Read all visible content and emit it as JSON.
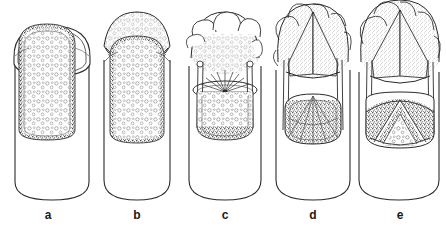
{
  "figure": {
    "style": "pen-and-ink line drawing, stippled shading, grayscale on white",
    "background_color": "#ffffff",
    "ink_color": "#1c1c1c",
    "stipple_color": "#555555",
    "fill_color": "#fdfdfd",
    "panel_count": 5
  },
  "panels": [
    {
      "label": "a",
      "label_x": 48,
      "label_y": 210,
      "cylinder": {
        "x": 14,
        "width": 76,
        "top": 40,
        "bottom": 200
      },
      "crown": {
        "type": "closed-dome",
        "description": "rounded cap enclosed by double outline, no external lobes",
        "top": 22,
        "bulge": 0
      },
      "interior": {
        "type": "cellular",
        "description": "scattered open cell circles inside a stippled border layer",
        "cell_count": 34,
        "has_granular_ring": true,
        "has_starburst": false,
        "arch_layers": 0
      },
      "struts": 0
    },
    {
      "label": "b",
      "label_x": 137,
      "label_y": 210,
      "cylinder": {
        "x": 103,
        "width": 69,
        "top": 46,
        "bottom": 200
      },
      "crown": {
        "type": "granular-cap",
        "description": "bumpy granular cap of small circles spilling over the rim",
        "top": 16,
        "bulge": 8
      },
      "interior": {
        "type": "cellular",
        "description": "open cell circles inside a stippled border layer",
        "cell_count": 30,
        "has_granular_ring": true,
        "has_starburst": false,
        "arch_layers": 0
      },
      "struts": 0
    },
    {
      "label": "c",
      "label_x": 225,
      "label_y": 210,
      "cylinder": {
        "x": 188,
        "width": 74,
        "top": 52,
        "bottom": 200
      },
      "crown": {
        "type": "lobed-foam",
        "description": "large lobed cloud-like crown of rounded bumps above a stippled mass",
        "top": 12,
        "bulge": 14
      },
      "interior": {
        "type": "cellular-with-burst",
        "description": "radiating starburst at centre above a cellular chamber with granular base",
        "cell_count": 22,
        "has_granular_ring": true,
        "has_starburst": true,
        "starburst_rays": 26,
        "arch_layers": 0
      },
      "struts": 4
    },
    {
      "label": "d",
      "label_x": 313,
      "label_y": 210,
      "cylinder": {
        "x": 275,
        "width": 75,
        "top": 56,
        "bottom": 200
      },
      "crown": {
        "type": "lobed-foam-split",
        "description": "broad lobed crown split by a dark central seam forming two inclined flanks",
        "top": 2,
        "bulge": 20
      },
      "interior": {
        "type": "domed-granular",
        "description": "rounded granular dome with radiating fan lines inside",
        "cell_count": 0,
        "has_granular_ring": true,
        "has_starburst": false,
        "arch_layers": 1
      },
      "struts": 4
    },
    {
      "label": "e",
      "label_x": 400,
      "label_y": 210,
      "cylinder": {
        "x": 358,
        "width": 80,
        "top": 58,
        "bottom": 200
      },
      "crown": {
        "type": "lobed-foam-split",
        "description": "tall lobed crown split by a central seam, flanks arching outward",
        "top": 0,
        "bulge": 24
      },
      "interior": {
        "type": "nested-arches",
        "description": "nested pointed gothic arches of stippled tissue around a cellular core",
        "cell_count": 16,
        "has_granular_ring": true,
        "has_starburst": false,
        "arch_layers": 3
      },
      "struts": 4
    }
  ]
}
